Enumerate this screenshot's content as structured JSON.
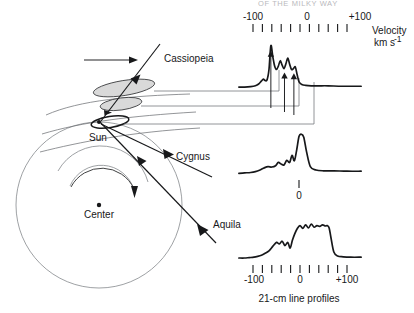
{
  "figure": {
    "caption": "21-cm line profiles",
    "cropped_header": "OF THE MILKY WAY",
    "axis": {
      "title_line1": "Velocity",
      "title_line2": "km s",
      "title_exponent": "-1",
      "label_minus100": "-100",
      "label_zero": "0",
      "label_plus100": "+100",
      "tick_count": 11,
      "tick_step_kms": 20,
      "range_kms": [
        -120,
        120
      ]
    },
    "map": {
      "sun_label": "Sun",
      "center_label": "Center",
      "direction_labels": {
        "cassiopeia": "Cassiopeia",
        "cygnus": "Cygnus",
        "aquila": "Aquila"
      }
    },
    "zero_marker_label": "0"
  },
  "chart_data": {
    "type": "line",
    "title": "21-cm line profiles",
    "xlabel": "Velocity km s^-1",
    "ylabel": "",
    "xlim": [
      -130,
      130
    ],
    "grid": false,
    "legend": "none",
    "panels": [
      {
        "name": "cassiopeia",
        "label": "Cassiopeia",
        "ticks_shown": true,
        "axis_labels_shown": true,
        "arrow_annotations_kms": [
          -62,
          -33,
          -13
        ],
        "x": [
          -130,
          -118,
          -105,
          -95,
          -88,
          -82,
          -78,
          -74,
          -70,
          -66,
          -62,
          -58,
          -54,
          -50,
          -46,
          -42,
          -38,
          -34,
          -30,
          -26,
          -22,
          -18,
          -14,
          -10,
          -6,
          -2,
          4,
          12,
          24,
          40,
          60,
          90,
          130
        ],
        "y": [
          0.02,
          0.02,
          0.03,
          0.05,
          0.09,
          0.16,
          0.2,
          0.17,
          0.19,
          0.42,
          0.96,
          0.72,
          0.5,
          0.42,
          0.5,
          0.62,
          0.52,
          0.44,
          0.55,
          0.68,
          0.54,
          0.42,
          0.44,
          0.48,
          0.3,
          0.14,
          0.08,
          0.06,
          0.05,
          0.05,
          0.05,
          0.04,
          0.04
        ]
      },
      {
        "name": "cygnus",
        "label": "Cygnus",
        "ticks_shown": false,
        "axis_labels_shown": false,
        "zero_tick_shown": true,
        "x": [
          -130,
          -118,
          -105,
          -95,
          -85,
          -76,
          -68,
          -60,
          -52,
          -46,
          -40,
          -34,
          -28,
          -22,
          -17,
          -12,
          -7,
          -2,
          3,
          8,
          14,
          22,
          34,
          50,
          72,
          100,
          130
        ],
        "y": [
          0.04,
          0.05,
          0.06,
          0.08,
          0.12,
          0.17,
          0.2,
          0.19,
          0.22,
          0.3,
          0.26,
          0.24,
          0.35,
          0.3,
          0.47,
          0.34,
          0.6,
          0.92,
          0.97,
          0.9,
          0.55,
          0.2,
          0.12,
          0.1,
          0.1,
          0.09,
          0.09
        ]
      },
      {
        "name": "aquila",
        "label": "Aquila",
        "ticks_shown": true,
        "axis_labels_shown": true,
        "x": [
          -130,
          -118,
          -108,
          -98,
          -90,
          -82,
          -74,
          -66,
          -58,
          -50,
          -44,
          -38,
          -32,
          -26,
          -21,
          -16,
          -11,
          -6,
          0,
          6,
          12,
          18,
          24,
          30,
          36,
          42,
          48,
          54,
          58,
          62,
          66,
          72,
          80,
          92,
          108,
          130
        ],
        "y": [
          0.05,
          0.05,
          0.06,
          0.07,
          0.09,
          0.12,
          0.17,
          0.23,
          0.34,
          0.44,
          0.4,
          0.47,
          0.36,
          0.44,
          0.3,
          0.5,
          0.66,
          0.78,
          0.86,
          0.79,
          0.88,
          0.8,
          0.9,
          0.82,
          0.86,
          0.84,
          0.88,
          0.85,
          0.86,
          0.8,
          0.55,
          0.2,
          0.1,
          0.08,
          0.07,
          0.07
        ]
      }
    ]
  }
}
